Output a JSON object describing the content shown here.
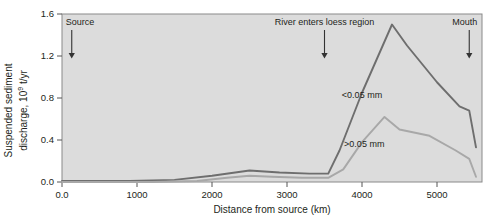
{
  "chart_data": {
    "type": "line",
    "title": "",
    "xlabel": "Distance from source (km)",
    "ylabel_line1": "Suspended sediment",
    "ylabel_line2_pre": "discharge, 10",
    "ylabel_exp": "9",
    "ylabel_line2_post": " t/yr",
    "xlim": [
      0,
      5600
    ],
    "ylim": [
      0.0,
      1.6
    ],
    "xticks": [
      0,
      1000,
      2000,
      3000,
      4000,
      5000
    ],
    "xticklabels": [
      "0.0",
      "1000",
      "2000",
      "3000",
      "4000",
      "5000"
    ],
    "yticks": [
      0.0,
      0.4,
      0.8,
      1.2,
      1.6
    ],
    "yticklabels": [
      "0.0",
      "0.4",
      "0.8",
      "1.2",
      "1.6"
    ],
    "grid": false,
    "legend": "inline-labels",
    "plot_background": "#dcdcdc",
    "series": [
      {
        "name": "<0.05 mm",
        "color": "#6e6e6e",
        "label_x": 4000,
        "label_y": 0.8,
        "x": [
          0,
          900,
          1500,
          2000,
          2500,
          2900,
          3300,
          3550,
          3700,
          4000,
          4400,
          4600,
          5000,
          5300,
          5430,
          5520
        ],
        "y": [
          0.01,
          0.01,
          0.02,
          0.06,
          0.11,
          0.09,
          0.08,
          0.08,
          0.3,
          0.85,
          1.5,
          1.3,
          0.95,
          0.72,
          0.68,
          0.33
        ]
      },
      {
        "name": ">0.05 mm",
        "color": "#a8a8a8",
        "label_x": 4030,
        "label_y": 0.33,
        "x": [
          0,
          1200,
          1800,
          2200,
          2500,
          2800,
          3200,
          3550,
          3750,
          4000,
          4300,
          4500,
          4900,
          5250,
          5430,
          5520
        ],
        "y": [
          0.0,
          0.0,
          0.01,
          0.04,
          0.06,
          0.05,
          0.04,
          0.04,
          0.12,
          0.38,
          0.62,
          0.5,
          0.44,
          0.3,
          0.22,
          0.05
        ]
      }
    ],
    "annotations": [
      {
        "text": "Source",
        "x": 130,
        "text_anchor": "start",
        "arrow_top": 0.0,
        "arrow_bottom": 0.0
      },
      {
        "text": "River enters loess region",
        "x": 3500,
        "text_anchor": "middle",
        "arrow_top": 0.0,
        "arrow_bottom": 0.0
      },
      {
        "text": "Mouth",
        "x": 5430,
        "text_anchor": "end",
        "arrow_top": 0.0,
        "arrow_bottom": 0.0
      }
    ]
  }
}
